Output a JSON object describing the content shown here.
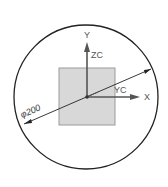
{
  "diagram": {
    "dimension_label": "φ200",
    "axes": {
      "y": "Y",
      "zc": "ZC",
      "yc": "YC",
      "x": "X"
    },
    "colors": {
      "circle": "#222222",
      "square_fill": "#d8d8d8",
      "square_stroke": "#9a9a9a",
      "axis": "#555555",
      "dimension_line": "#222222"
    }
  }
}
